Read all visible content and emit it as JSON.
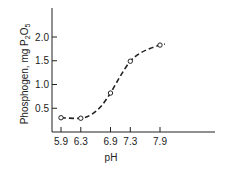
{
  "chart_data": {
    "type": "line",
    "title": "",
    "xlabel": "pH",
    "ylabel": "Phosphogen, mg P2O5",
    "ylabel_parts": {
      "main": "Phosphogen, mg P",
      "sub1": "2",
      "mid": "O",
      "sub2": "5"
    },
    "x_ticks": [
      5.9,
      6.3,
      6.9,
      7.3,
      7.9
    ],
    "x_tick_labels": [
      "5.9",
      "6.3",
      "6.9",
      "7.3",
      "7.9"
    ],
    "y_ticks": [
      0.5,
      1.0,
      1.5,
      2.0
    ],
    "y_tick_labels": [
      "0.5",
      "1.0",
      "1.5",
      "2.0"
    ],
    "xlim": [
      5.7,
      8.8
    ],
    "ylim": [
      0,
      2.6
    ],
    "grid": false,
    "legend": "none",
    "series": [
      {
        "name": "Phosphogen",
        "style": "dashed-with-open-circles",
        "x": [
          5.9,
          6.3,
          6.9,
          7.3,
          7.9
        ],
        "y": [
          0.3,
          0.29,
          0.82,
          1.49,
          1.83
        ]
      }
    ],
    "curve": {
      "x": [
        5.9,
        6.3,
        6.5,
        6.7,
        6.9,
        7.1,
        7.3,
        7.5,
        7.7,
        7.9,
        8.0
      ],
      "y": [
        0.3,
        0.29,
        0.36,
        0.53,
        0.82,
        1.18,
        1.49,
        1.66,
        1.76,
        1.83,
        1.85
      ]
    }
  }
}
